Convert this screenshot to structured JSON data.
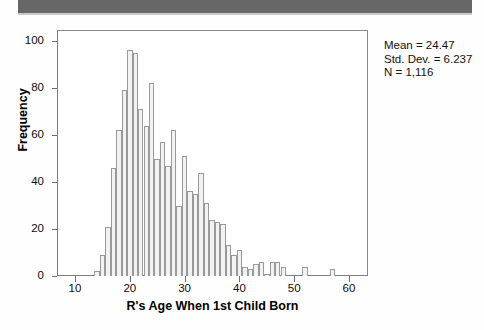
{
  "banner": {
    "color": "#676767"
  },
  "stats": {
    "mean_line": "Mean = 24.47",
    "stddev_line": "Std. Dev. = 6.237",
    "n_line": "N = 1,116"
  },
  "axis": {
    "x_title": "R's Age When 1st Child Born",
    "y_title": "Frequency",
    "x_ticks": [
      "10",
      "20",
      "30",
      "40",
      "50",
      "60"
    ],
    "y_ticks": [
      "0",
      "20",
      "40",
      "60",
      "80",
      "100"
    ]
  },
  "chart_data": {
    "type": "bar",
    "title": "",
    "subtitle": "",
    "xlabel": "R's Age When 1st Child Born",
    "ylabel": "Frequency",
    "xlim": [
      8,
      62
    ],
    "ylim": [
      0,
      100
    ],
    "grid": false,
    "legend": null,
    "bin_width": 1,
    "annotations": [
      "Mean = 24.47",
      "Std. Dev. = 6.237",
      "N = 1,116"
    ],
    "statistics": {
      "mean": 24.47,
      "std_dev": 6.237,
      "n": 1116
    },
    "categories": [
      14,
      15,
      16,
      17,
      18,
      19,
      20,
      21,
      22,
      23,
      24,
      25,
      26,
      27,
      28,
      29,
      30,
      31,
      32,
      33,
      34,
      35,
      36,
      37,
      38,
      39,
      40,
      41,
      42,
      43,
      44,
      45,
      46,
      47,
      48,
      52,
      57
    ],
    "values": [
      2,
      9,
      21,
      46,
      62,
      79,
      96,
      95,
      71,
      64,
      82,
      50,
      57,
      47,
      62,
      30,
      51,
      36,
      35,
      44,
      31,
      24,
      23,
      22,
      13,
      9,
      11,
      4,
      3,
      5,
      6,
      1,
      6,
      6,
      4,
      4,
      3
    ],
    "x_tick_values": [
      10,
      20,
      30,
      40,
      50,
      60
    ],
    "y_tick_values": [
      0,
      20,
      40,
      60,
      80,
      100
    ]
  }
}
